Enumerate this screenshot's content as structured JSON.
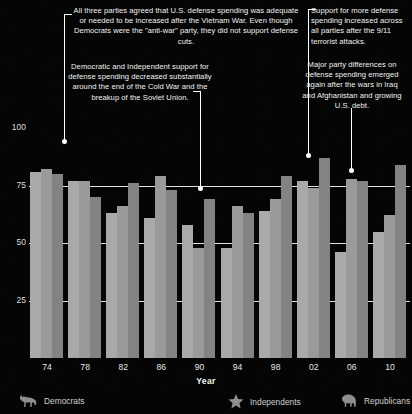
{
  "annotations": {
    "vietnam": "All three parties agreed that U.S. defense spending was adequate or needed to be increased after the Vietnam War. Even though Democrats were the \"anti-war\" party, they did not support defense cuts.",
    "coldwar": "Democratic and Independent support for defense spending decreased substantially around the end of the Cold War and the breakup of the Soviet Union.",
    "nine_eleven": "Support for more defense spending increased across all parties after the 9/11 terrorist attacks.",
    "iraq": "Major party differences on defense spending emerged again after the wars in Iraq and Afghanistan and growing U.S. debt."
  },
  "legend": {
    "items": [
      {
        "label": "Democrats",
        "icon": "donkey-icon",
        "color": "#a9a9a9"
      },
      {
        "label": "Independents",
        "icon": "star-icon",
        "color": "#9a9a9a"
      },
      {
        "label": "Republicans",
        "icon": "elephant-icon",
        "color": "#838383"
      }
    ]
  },
  "chart_data": {
    "type": "bar",
    "title": "",
    "xlabel": "Year",
    "ylabel": "or Increased Defense Spending",
    "ylim": [
      0,
      100
    ],
    "yticks": [
      25,
      50,
      75,
      100
    ],
    "grid": true,
    "legend_position": "bottom",
    "categories": [
      "74",
      "78",
      "82",
      "86",
      "90",
      "94",
      "98",
      "02",
      "06",
      "10"
    ],
    "series": [
      {
        "name": "Democrats",
        "color": "#a9a9a9",
        "values": [
          81,
          77,
          63,
          61,
          58,
          48,
          64,
          77,
          46,
          55
        ]
      },
      {
        "name": "Independents",
        "color": "#9a9a9a",
        "values": [
          82,
          77,
          66,
          79,
          48,
          66,
          69,
          74,
          78,
          62
        ]
      },
      {
        "name": "Republicans",
        "color": "#838383",
        "values": [
          80,
          70,
          76,
          73,
          69,
          63,
          79,
          87,
          77,
          84
        ]
      }
    ]
  }
}
